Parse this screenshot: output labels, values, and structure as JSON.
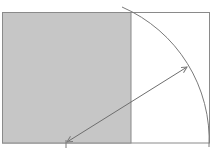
{
  "diagram": {
    "type": "golden-rectangle-construction",
    "colors": {
      "background": "#ffffff",
      "square_fill": "#c6c6c6",
      "line": "#7a7a7a"
    },
    "rectangle": {
      "x": 2,
      "y": 12,
      "width": 208,
      "height": 131
    },
    "square": {
      "x": 2,
      "y": 12,
      "width": 129,
      "height": 131
    },
    "arc": {
      "start": [
        122,
        7
      ],
      "end": [
        209,
        147
      ],
      "center": [
        66,
        143
      ]
    },
    "arrow": {
      "from": [
        66,
        143
      ],
      "to": [
        188,
        66
      ]
    }
  }
}
